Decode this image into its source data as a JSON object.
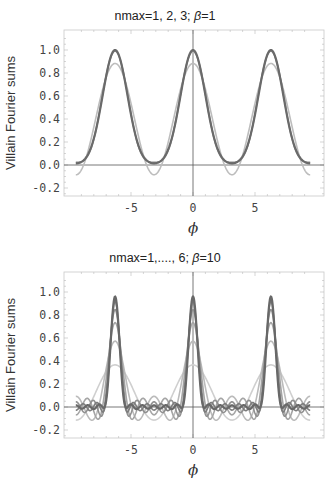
{
  "chart_data": [
    {
      "type": "line",
      "title": "nmax=1, 2, 3;  β=1",
      "title_parts": {
        "prefix": "nmax=1, 2, 3;  ",
        "beta_symbol": "β",
        "suffix": "=1"
      },
      "xlabel": "ϕ",
      "ylabel": "Villain Fourier sums",
      "xlim": [
        -9.5,
        9.5
      ],
      "ylim": [
        -0.28,
        1.15
      ],
      "xticks": [
        -5,
        0,
        5
      ],
      "xtick_labels": [
        "-5",
        "0",
        "5"
      ],
      "yticks": [
        -0.2,
        0.0,
        0.2,
        0.4,
        0.6,
        0.8,
        1.0
      ],
      "ytick_labels": [
        "-0.2",
        "0.0",
        "0.2",
        "0.4",
        "0.6",
        "0.8",
        "1.0"
      ],
      "grid": false,
      "legend": null,
      "beta": 1,
      "nmax_values": [
        1,
        2,
        3
      ],
      "series": [
        {
          "name": "nmax=1",
          "peak_at_0": 0.88,
          "min_at_pi": -0.085,
          "color": "#bdbdbd"
        },
        {
          "name": "nmax=2",
          "peak_at_0": 1.0,
          "min_at_pi": 0.01,
          "color": "#8a8a8a"
        },
        {
          "name": "nmax=3",
          "peak_at_0": 1.0,
          "min_at_pi": 0.02,
          "color": "#6a6a6a"
        }
      ],
      "frame": {
        "left": 64,
        "right": 324,
        "top": 30,
        "bottom": 196
      }
    },
    {
      "type": "line",
      "title": "nmax=1,...., 6;  β=10",
      "title_parts": {
        "prefix": "nmax=1,...., 6;  ",
        "beta_symbol": "β",
        "suffix": "=10"
      },
      "xlabel": "ϕ",
      "ylabel": "Villain Fourier sums",
      "xlim": [
        -9.5,
        9.5
      ],
      "ylim": [
        -0.28,
        1.15
      ],
      "xticks": [
        -5,
        0,
        5
      ],
      "xtick_labels": [
        "-5",
        "0",
        "5"
      ],
      "yticks": [
        -0.2,
        0.0,
        0.2,
        0.4,
        0.6,
        0.8,
        1.0
      ],
      "ytick_labels": [
        "-0.2",
        "0.0",
        "0.2",
        "0.4",
        "0.6",
        "0.8",
        "1.0"
      ],
      "grid": false,
      "legend": null,
      "beta": 10,
      "nmax_values": [
        1,
        2,
        3,
        4,
        5,
        6
      ],
      "series": [
        {
          "name": "nmax=1",
          "peak_at_0": 0.37,
          "color": "#cfcfcf"
        },
        {
          "name": "nmax=2",
          "peak_at_0": 0.57,
          "color": "#bbbbbb"
        },
        {
          "name": "nmax=3",
          "peak_at_0": 0.73,
          "color": "#a5a5a5"
        },
        {
          "name": "nmax=4",
          "peak_at_0": 0.85,
          "color": "#909090"
        },
        {
          "name": "nmax=5",
          "peak_at_0": 0.93,
          "color": "#7c7c7c"
        },
        {
          "name": "nmax=6",
          "peak_at_0": 0.98,
          "color": "#686868"
        }
      ],
      "frame": {
        "left": 64,
        "right": 324,
        "top": 272,
        "bottom": 438
      }
    }
  ],
  "panels": [
    {
      "title_prefix": "nmax=1, 2, 3;  ",
      "beta_symbol": "β",
      "title_suffix": "=1"
    },
    {
      "title_prefix": "nmax=1,...., 6;  ",
      "beta_symbol": "β",
      "title_suffix": "=10"
    }
  ]
}
